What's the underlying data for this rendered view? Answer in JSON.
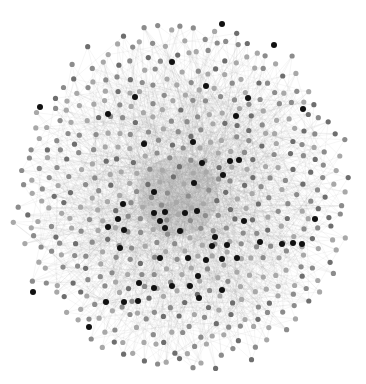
{
  "diagram": {
    "type": "network-graph",
    "layout": "force-directed",
    "background": "#ffffff",
    "center": [
      183,
      196
    ],
    "radius": 168,
    "node_count": 520,
    "node_radius": 2.6,
    "edge_color": "#9a9a9a",
    "edge_opacity": 0.18,
    "edges_per_node": 3,
    "node_colors": {
      "light": "#a8a8a8",
      "mid": "#8c8c8c",
      "dark_mid": "#6e6e6e",
      "hub": "#111111"
    },
    "hub_nodes": [
      [
        222,
        24
      ],
      [
        274,
        45
      ],
      [
        172,
        62
      ],
      [
        40,
        107
      ],
      [
        135,
        97
      ],
      [
        108,
        114
      ],
      [
        206,
        86
      ],
      [
        248,
        98
      ],
      [
        236,
        116
      ],
      [
        144,
        144
      ],
      [
        239,
        160
      ],
      [
        193,
        142
      ],
      [
        303,
        109
      ],
      [
        202,
        163
      ],
      [
        230,
        161
      ],
      [
        223,
        175
      ],
      [
        194,
        183
      ],
      [
        154,
        192
      ],
      [
        165,
        212
      ],
      [
        154,
        213
      ],
      [
        185,
        213
      ],
      [
        123,
        204
      ],
      [
        118,
        219
      ],
      [
        124,
        230
      ],
      [
        108,
        227
      ],
      [
        160,
        221
      ],
      [
        180,
        231
      ],
      [
        197,
        211
      ],
      [
        212,
        246
      ],
      [
        227,
        245
      ],
      [
        222,
        259
      ],
      [
        215,
        237
      ],
      [
        198,
        276
      ],
      [
        172,
        286
      ],
      [
        199,
        298
      ],
      [
        237,
        258
      ],
      [
        244,
        221
      ],
      [
        260,
        242
      ],
      [
        282,
        244
      ],
      [
        293,
        243
      ],
      [
        302,
        244
      ],
      [
        315,
        219
      ],
      [
        139,
        283
      ],
      [
        124,
        302
      ],
      [
        106,
        302
      ],
      [
        33,
        292
      ],
      [
        89,
        327
      ],
      [
        154,
        288
      ],
      [
        138,
        301
      ],
      [
        206,
        260
      ],
      [
        160,
        258
      ],
      [
        188,
        258
      ],
      [
        190,
        286
      ],
      [
        120,
        248
      ],
      [
        165,
        228
      ],
      [
        222,
        290
      ]
    ]
  }
}
